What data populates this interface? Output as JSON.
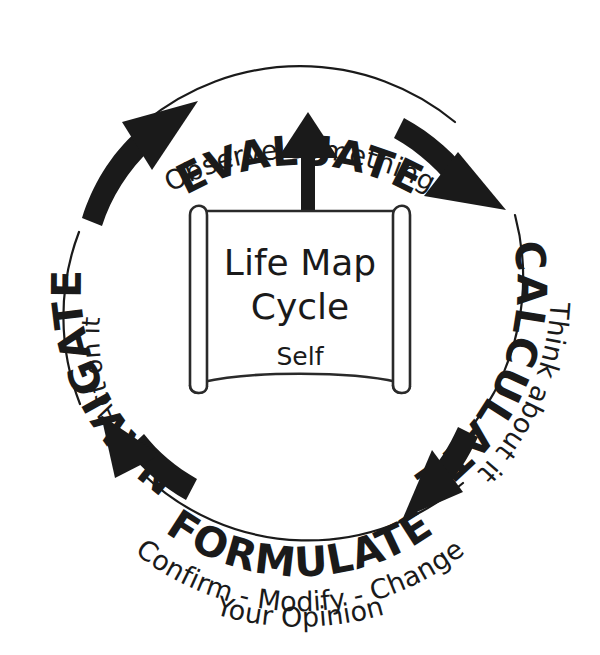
{
  "diagram": {
    "title": "Life Map Cycle",
    "center": {
      "title_line1": "Life Map",
      "title_line2": "Cycle",
      "subtitle": "Self"
    },
    "colors": {
      "ink": "#1a1a1a",
      "outline": "#2a2a2a",
      "background": "#ffffff"
    },
    "direction": "clockwise",
    "stages": [
      {
        "id": "evaluate",
        "label": "EVALUATE",
        "caption": "Observe Something",
        "caption_position": "outside",
        "position": "top"
      },
      {
        "id": "calculate",
        "label": "CALCULATE",
        "caption": "Think about it",
        "caption_position": "outside",
        "position": "right"
      },
      {
        "id": "formulate",
        "label": "FORMULATE",
        "caption_line1": "Confirm - Modify - Change",
        "caption_line2": "Your Opinion",
        "caption_position": "outside",
        "position": "bottom"
      },
      {
        "id": "navigate",
        "label": "NAVIGATE",
        "caption": "Act on it",
        "caption_position": "inside",
        "position": "left"
      }
    ],
    "arrows": [
      {
        "id": "evaluate-to-calculate",
        "from": "EVALUATE",
        "to": "CALCULATE"
      },
      {
        "id": "calculate-to-formulate",
        "from": "CALCULATE",
        "to": "FORMULATE"
      },
      {
        "id": "formulate-to-navigate",
        "from": "FORMULATE",
        "to": "NAVIGATE"
      },
      {
        "id": "navigate-to-evaluate",
        "from": "NAVIGATE",
        "to": "EVALUATE"
      },
      {
        "id": "self-to-evaluate",
        "from": "Self",
        "to": "EVALUATE"
      }
    ]
  }
}
